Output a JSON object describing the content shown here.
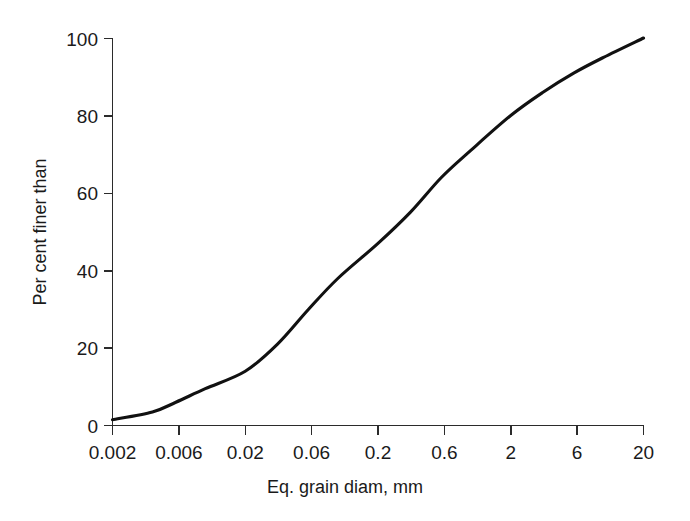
{
  "chart_data": {
    "type": "line",
    "title": "",
    "xlabel": "Eq. grain diam, mm",
    "ylabel": "Per cent finer than",
    "xscale": "log",
    "yscale": "linear",
    "grid": false,
    "legend": false,
    "xticklabels": [
      "0.002",
      "0.006",
      "0.02",
      "0.06",
      "0.2",
      "0.6",
      "2",
      "6",
      "20"
    ],
    "xtickvalues": [
      0.002,
      0.006,
      0.02,
      0.06,
      0.2,
      0.6,
      2,
      6,
      20
    ],
    "yticklabels": [
      "0",
      "20",
      "40",
      "60",
      "80",
      "100"
    ],
    "ytickvalues": [
      0,
      20,
      40,
      60,
      80,
      100
    ],
    "xlim": [
      0.002,
      20
    ],
    "ylim": [
      0,
      100
    ],
    "series": [
      {
        "name": "Grain size distribution",
        "color": "#111111",
        "x": [
          0.002,
          0.004,
          0.006,
          0.01,
          0.02,
          0.035,
          0.06,
          0.1,
          0.2,
          0.35,
          0.6,
          1.0,
          2.0,
          3.5,
          6.0,
          10.0,
          20.0
        ],
        "values": [
          1.5,
          3.5,
          6.0,
          9.5,
          14.0,
          21.0,
          30.0,
          38.0,
          47.0,
          55.0,
          64.0,
          71.0,
          80.0,
          86.0,
          91.0,
          95.0,
          100.0
        ]
      }
    ]
  },
  "axes": {
    "y_axis_label": "Per cent finer than",
    "x_axis_label": "Eq. grain diam, mm"
  }
}
